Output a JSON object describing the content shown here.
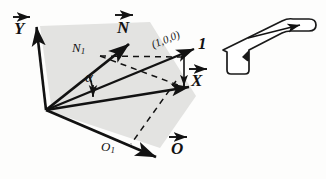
{
  "figure": {
    "title_alt": "Vector diagram with shaded plane and tool inset",
    "background_color": "#fdfdfc",
    "shade_color": "#e3e3e1",
    "ink_color": "#121212"
  },
  "labels": {
    "y_vector": "Y",
    "n_vector": "N",
    "n1_label": "N",
    "n1_sub": "1",
    "alpha": "α",
    "coord_triple": "(1,0,0)",
    "one": "1",
    "x_vector": "X",
    "o_vector": "O",
    "o1_label": "O",
    "o1_sub": "1"
  },
  "geometry": {
    "origin": [
      46,
      110
    ],
    "y_tip": [
      36,
      24
    ],
    "n_tip": [
      131,
      42
    ],
    "n1_ray_tip": [
      118,
      52
    ],
    "one_tip": [
      196,
      48
    ],
    "x_tip": [
      191,
      87
    ],
    "o_tip": [
      158,
      158
    ],
    "shade_polygon": "40,26 150,22 196,96 160,148 52,112",
    "angle_arc_radius": 46
  },
  "inset": {
    "name": "tool-outline",
    "arrow_direction": "right"
  }
}
